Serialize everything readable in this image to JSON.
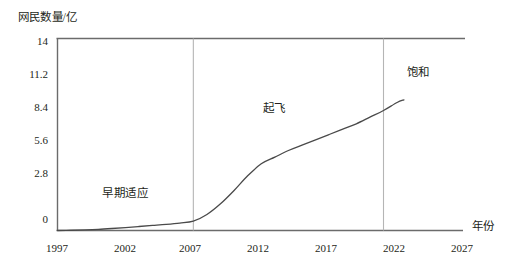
{
  "chart_data": {
    "type": "line",
    "title": "",
    "subtitle": "",
    "xlabel": "年份",
    "ylabel": "网民数量/亿",
    "xlim": [
      1997,
      2027
    ],
    "ylim": [
      0,
      14.4
    ],
    "grid": false,
    "legend": "none",
    "x_ticks": [
      "1997",
      "2002",
      "2007",
      "2012",
      "2017",
      "2022",
      "2027"
    ],
    "y_ticks": [
      "0",
      "2.8",
      "5.6",
      "8.4",
      "11.2",
      "14"
    ],
    "x_tick_values": [
      1997,
      2002,
      2007,
      2012,
      2017,
      2022,
      2027
    ],
    "y_tick_values": [
      0,
      2.8,
      5.6,
      8.4,
      11.2,
      14
    ],
    "series": [
      {
        "name": "网民数量",
        "x": [
          1997,
          1998,
          1999,
          2000,
          2001,
          2002,
          2003,
          2004,
          2005,
          2006,
          2007,
          2008,
          2009,
          2010,
          2011,
          2012,
          2013,
          2014,
          2015,
          2016,
          2017,
          2018,
          2019,
          2020,
          2021,
          2022,
          2022.5
        ],
        "values": [
          0.0,
          0.02,
          0.05,
          0.09,
          0.15,
          0.22,
          0.3,
          0.38,
          0.46,
          0.56,
          0.7,
          1.2,
          2.0,
          3.0,
          4.1,
          5.0,
          5.5,
          6.0,
          6.4,
          6.8,
          7.2,
          7.6,
          8.0,
          8.5,
          9.0,
          9.6,
          9.8
        ]
      }
    ],
    "annotations": [
      {
        "text": "早期适应",
        "x": 2002.3,
        "y": 1.7
      },
      {
        "text": "起飞",
        "x": 2014.0,
        "y": 7.6
      },
      {
        "text": "饱和",
        "x": 2023.0,
        "y": 11.3
      }
    ],
    "phase_dividers": [
      {
        "x": 2007
      },
      {
        "x": 2021
      }
    ],
    "colors": {
      "curve": "#4a4a4a",
      "axis": "#6b6b6b",
      "divider": "#b5b5b5",
      "text": "#231f20",
      "background": "#ffffff"
    }
  },
  "axis_titles": {
    "y": "网民数量/亿",
    "x": "年份"
  },
  "y_tick_labels": [
    "14",
    "11.2",
    "8.4",
    "5.6",
    "2.8",
    "0"
  ],
  "x_tick_labels": [
    "1997",
    "2002",
    "2007",
    "2012",
    "2017",
    "2022",
    "2027"
  ],
  "phase_labels": [
    "早期适应",
    "起飞",
    "饱和"
  ]
}
